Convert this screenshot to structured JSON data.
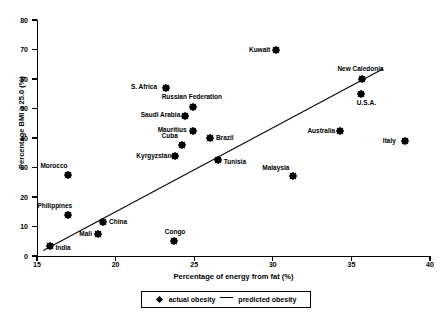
{
  "chart_data": {
    "type": "scatter",
    "title": "",
    "xlabel": "Percentage of energy from fat (%)",
    "ylabel": "Percentage BMI ≥ 25.0 (%)",
    "xlim": [
      15,
      40
    ],
    "ylim": [
      0,
      80
    ],
    "xticks": [
      15,
      20,
      25,
      30,
      35,
      40
    ],
    "yticks": [
      0,
      10,
      20,
      30,
      40,
      50,
      60,
      70,
      80
    ],
    "grid": false,
    "legend_position": "bottom-center",
    "legend": [
      {
        "label": "actual obesity",
        "marker": "diamond"
      },
      {
        "label": "predicted obesity",
        "marker": "line"
      }
    ],
    "points": [
      {
        "name": "India",
        "x": 15.8,
        "y": 3.5,
        "lx": 6,
        "ly": 1
      },
      {
        "name": "Morocco",
        "x": 17.0,
        "y": 27.5,
        "lx": -28,
        "ly": -10
      },
      {
        "name": "Philippines",
        "x": 17.0,
        "y": 14.0,
        "lx": -31,
        "ly": -10
      },
      {
        "name": "Mali",
        "x": 18.9,
        "y": 7.5,
        "lx": -19,
        "ly": -1
      },
      {
        "name": "China",
        "x": 19.2,
        "y": 11.5,
        "lx": 6,
        "ly": -1
      },
      {
        "name": "S. Africa",
        "x": 23.2,
        "y": 57.0,
        "lx": -35,
        "ly": -2
      },
      {
        "name": "Congo",
        "x": 23.7,
        "y": 5.0,
        "lx": -9,
        "ly": -10
      },
      {
        "name": "Kyrgyzstan",
        "x": 23.8,
        "y": 34.0,
        "lx": -39,
        "ly": -1
      },
      {
        "name": "Saudi Arabia",
        "x": 24.4,
        "y": 47.5,
        "lx": -44,
        "ly": -2
      },
      {
        "name": "Russian Federation",
        "x": 24.9,
        "y": 50.5,
        "lx": -31,
        "ly": -11
      },
      {
        "name": "Mauritius",
        "x": 24.9,
        "y": 42.5,
        "lx": -35,
        "ly": -2
      },
      {
        "name": "Cuba",
        "x": 24.2,
        "y": 37.5,
        "lx": -20,
        "ly": -10
      },
      {
        "name": "Brazil",
        "x": 26.0,
        "y": 40.0,
        "lx": 6,
        "ly": -1
      },
      {
        "name": "Tunisia",
        "x": 26.5,
        "y": 32.5,
        "lx": 6,
        "ly": 1
      },
      {
        "name": "Kuwait",
        "x": 30.2,
        "y": 70.0,
        "lx": -27,
        "ly": -1
      },
      {
        "name": "Malaysia",
        "x": 31.3,
        "y": 27.0,
        "lx": -31,
        "ly": -9
      },
      {
        "name": "Australia",
        "x": 34.3,
        "y": 42.5,
        "lx": -33,
        "ly": -1
      },
      {
        "name": "New Caledonia",
        "x": 35.7,
        "y": 60.0,
        "lx": -25,
        "ly": -11
      },
      {
        "name": "U.S.A.",
        "x": 35.6,
        "y": 55.0,
        "lx": -4,
        "ly": 8
      },
      {
        "name": "Italy",
        "x": 38.4,
        "y": 39.0,
        "lx": -22,
        "ly": -1
      }
    ],
    "fit_line": {
      "x0": 15.4,
      "y0": 2.0,
      "x1": 37.0,
      "y1": 63.5,
      "label": "predicted obesity"
    }
  }
}
